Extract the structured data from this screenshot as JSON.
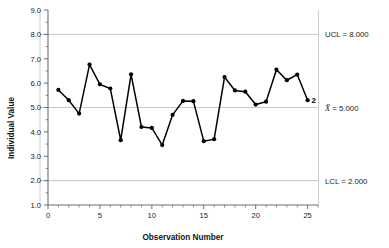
{
  "chart_data": {
    "type": "line",
    "title": "",
    "subtitle": "",
    "xlabel": "Observation Number",
    "ylabel": "Individual Value",
    "xlim": [
      0,
      26
    ],
    "ylim": [
      1.0,
      9.0
    ],
    "grid": true,
    "legend_position": "right-outside",
    "x": [
      1,
      2,
      3,
      4,
      5,
      6,
      7,
      8,
      9,
      10,
      11,
      12,
      13,
      14,
      15,
      16,
      17,
      18,
      19,
      20,
      21,
      22,
      23,
      24,
      25
    ],
    "values": [
      5.72,
      5.3,
      4.75,
      6.76,
      5.95,
      5.78,
      3.66,
      6.36,
      4.2,
      4.16,
      3.46,
      4.7,
      5.27,
      5.26,
      3.62,
      3.7,
      6.25,
      5.7,
      5.65,
      5.12,
      5.24,
      6.55,
      6.12,
      6.35,
      5.3
    ],
    "series": [
      {
        "name": "Individual Value",
        "values": [
          5.72,
          5.3,
          4.75,
          6.76,
          5.95,
          5.78,
          3.66,
          6.36,
          4.2,
          4.16,
          3.46,
          4.7,
          5.27,
          5.26,
          3.62,
          3.7,
          6.25,
          5.7,
          5.65,
          5.12,
          5.24,
          6.55,
          6.12,
          6.35,
          5.3
        ],
        "color": "#000000",
        "marker": "circle"
      }
    ],
    "x_tick_labels": [
      "0",
      "5",
      "10",
      "15",
      "20",
      "25"
    ],
    "x_tick_values": [
      0,
      5,
      10,
      15,
      20,
      25
    ],
    "x_minor_tick_step": 1,
    "y_tick_labels": [
      "1.0",
      "2.0",
      "3.0",
      "4.0",
      "5.0",
      "6.0",
      "7.0",
      "8.0",
      "9.0"
    ],
    "y_tick_values": [
      1.0,
      2.0,
      3.0,
      4.0,
      5.0,
      6.0,
      7.0,
      8.0,
      9.0
    ],
    "y_minor_tick_step": 0.5,
    "control_limits": [
      {
        "id": "ucl",
        "label": "UCL = 8.000",
        "value": 8.0,
        "prefix": "UCL",
        "number": "8.000"
      },
      {
        "id": "center",
        "label": "X̄ = 5.000",
        "value": 5.0,
        "prefix": "X̄",
        "number": "5.000"
      },
      {
        "id": "lcl",
        "label": "LCL = 2.000",
        "value": 2.0,
        "prefix": "LCL",
        "number": "2.000"
      }
    ],
    "annotations": [
      {
        "id": "violation-2",
        "text": "2",
        "x": 25,
        "y": 5.3,
        "note": "out-of-control test number"
      }
    ],
    "colors": {
      "series": "#000000",
      "gridline": "#b9b9b9",
      "axis": "#6e6e6e",
      "text": "#1a1a1a",
      "background": "#ffffff"
    }
  },
  "labels": {
    "ylabel": "Individual Value",
    "xlabel": "Observation Number",
    "ucl": "UCL = 8.000",
    "center_prefix": "X̄",
    "center_rest": " = 5.000",
    "lcl": "LCL = 2.000",
    "violation": "2"
  }
}
